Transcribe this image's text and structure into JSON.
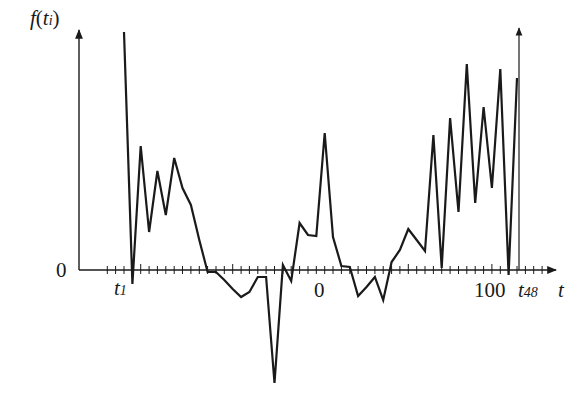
{
  "chart_data": {
    "type": "line",
    "title": "",
    "ylabel": "f(t_i)",
    "xlabel": "t",
    "x_tick_labels": [
      {
        "text": "t1",
        "main": "t",
        "sub": "1",
        "px": 124
      },
      {
        "text": "0",
        "px": 321
      },
      {
        "text": "100",
        "px": 492
      },
      {
        "text": "t48",
        "main": "t",
        "sub": "48",
        "px": 517
      }
    ],
    "y_tick_labels": [
      {
        "text": "0",
        "py": 270
      }
    ],
    "x": [
      1,
      2,
      3,
      4,
      5,
      6,
      7,
      8,
      9,
      10,
      11,
      12,
      13,
      14,
      15,
      16,
      17,
      18,
      19,
      20,
      21,
      22,
      23,
      24,
      25,
      26,
      27,
      28,
      29,
      30,
      31,
      32,
      33,
      34,
      35,
      36,
      37,
      38,
      39,
      40,
      41,
      42,
      43,
      44,
      45,
      46,
      47,
      48
    ],
    "series": [
      {
        "name": "f(t_i)",
        "values": [
          238,
          -14,
          124,
          38,
          99,
          55,
          112,
          82,
          65,
          30,
          -2,
          -2,
          -10,
          -19,
          -27,
          -22,
          -7,
          -7,
          -113,
          5,
          -11,
          47,
          35,
          34,
          137,
          33,
          4,
          3,
          -26,
          -17,
          -7,
          -30,
          8,
          20,
          41,
          30,
          19,
          135,
          2,
          152,
          58,
          206,
          67,
          163,
          82,
          201,
          -5,
          192
        ]
      }
    ],
    "ylim": [
      -125,
      240
    ],
    "grid": false,
    "legend": null
  },
  "labels": {
    "y_axis_main": "f",
    "y_axis_open": "(",
    "y_axis_t": "t",
    "y_axis_sub": "i",
    "y_axis_close": ")",
    "y_zero": "0",
    "x_axis": "t",
    "t1_main": "t",
    "t1_sub": "1",
    "center_zero": "0",
    "hundred": "100",
    "t48_main": "t",
    "t48_sub": "48"
  },
  "colors": {
    "line": "#1a1a1a",
    "axis": "#1a1a1a",
    "background": "#ffffff"
  }
}
